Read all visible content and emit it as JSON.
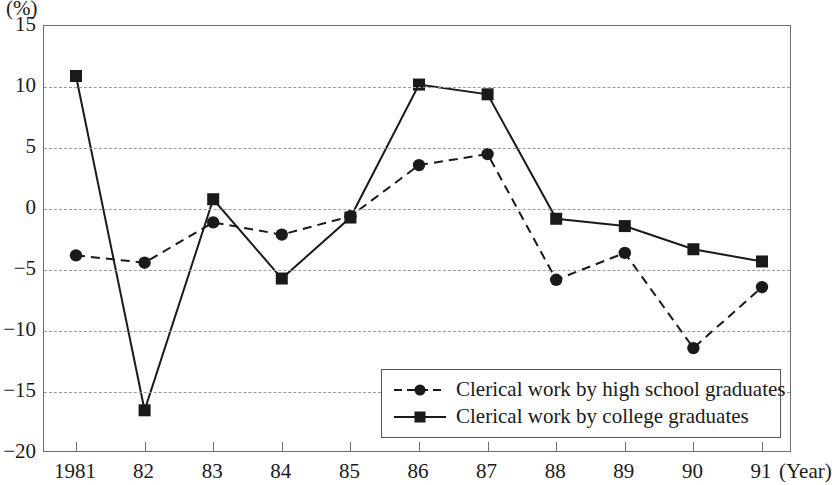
{
  "chart_data": {
    "type": "line",
    "title": "",
    "unit_label": "(%)",
    "xlabel": "(Year)",
    "ylabel": "",
    "grid": true,
    "legend_position": "bottom-right",
    "x": [
      "1981",
      "82",
      "83",
      "84",
      "85",
      "86",
      "87",
      "88",
      "89",
      "90",
      "91"
    ],
    "categories": [
      "1981",
      "82",
      "83",
      "84",
      "85",
      "86",
      "87",
      "88",
      "89",
      "90",
      "91"
    ],
    "xtick_labels": [
      "1981",
      "82",
      "83",
      "84",
      "85",
      "86",
      "87",
      "88",
      "89",
      "90",
      "91"
    ],
    "ytick_labels": [
      "15",
      "10",
      "5",
      "0",
      "−5",
      "−10",
      "−15",
      "−20"
    ],
    "yticks": [
      15,
      10,
      5,
      0,
      -5,
      -10,
      -15,
      -20
    ],
    "ylim": [
      -20,
      15
    ],
    "series": [
      {
        "name": "Clerical work by high school graduates",
        "marker": "circle",
        "line_style": "dashed",
        "color": "#1a1a1a",
        "values": [
          -3.8,
          -4.4,
          -1.1,
          -2.1,
          -0.6,
          3.6,
          4.5,
          -5.8,
          -3.6,
          -11.4,
          -6.4
        ]
      },
      {
        "name": "Clerical work by college graduates",
        "marker": "square",
        "line_style": "solid",
        "color": "#1a1a1a",
        "values": [
          10.9,
          -16.5,
          0.8,
          -5.7,
          -0.7,
          10.2,
          9.4,
          -0.8,
          -1.4,
          -3.3,
          -4.3
        ]
      }
    ]
  },
  "legend": {
    "entries": [
      {
        "label": "Clerical work by high school graduates",
        "marker": "circle",
        "line_style": "dashed"
      },
      {
        "label": "Clerical work by college graduates",
        "marker": "square",
        "line_style": "solid"
      }
    ]
  }
}
